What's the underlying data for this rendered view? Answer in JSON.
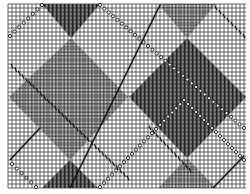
{
  "pattern": {
    "type": "argyle-knitting-chart",
    "background": "#ffffff",
    "grid": {
      "x": 8,
      "y": 4,
      "width": 238,
      "height": 184,
      "cell": 4,
      "color": "#222222"
    },
    "colors": {
      "dark": "#555555",
      "dotted": "#9a9a9a",
      "line": "#111111"
    },
    "diamonds": [
      {
        "name": "dark-top",
        "fill": "dark",
        "points": "42,4 100,4 71,38"
      },
      {
        "name": "dotted-left",
        "fill": "dotted",
        "points": "71,38 128,97 70,160 10,98 10,96"
      },
      {
        "name": "dark-right",
        "fill": "dark",
        "points": "187,38 246,97 187,158 129,97"
      },
      {
        "name": "dotted-top-right",
        "fill": "dotted",
        "points": "158,4 216,4 187,38"
      },
      {
        "name": "dark-bottom-left",
        "fill": "dark",
        "points": "70,160 98,188 42,188"
      },
      {
        "name": "dotted-bottom-right",
        "fill": "dotted",
        "points": "187,158 216,188 158,188"
      }
    ],
    "lines": [
      {
        "name": "circle-line-a",
        "style": "circles",
        "x1": 10,
        "y1": 36,
        "x2": 42,
        "y2": 5
      },
      {
        "name": "circle-line-b",
        "style": "circles",
        "x1": 100,
        "y1": 5,
        "x2": 244,
        "y2": 128
      },
      {
        "name": "circle-line-c",
        "style": "circles",
        "x1": 12,
        "y1": 164,
        "x2": 36,
        "y2": 187
      },
      {
        "name": "circle-line-d",
        "style": "circles",
        "x1": 100,
        "y1": 187,
        "x2": 184,
        "y2": 100
      },
      {
        "name": "circle-line-e",
        "style": "circles",
        "x1": 184,
        "y1": 100,
        "x2": 244,
        "y2": 160
      },
      {
        "name": "solid-line-a",
        "style": "solid",
        "x1": 70,
        "y1": 188,
        "x2": 160,
        "y2": 5
      },
      {
        "name": "solid-line-b",
        "style": "solid",
        "x1": 10,
        "y1": 160,
        "x2": 40,
        "y2": 128
      },
      {
        "name": "solid-line-c",
        "style": "solid",
        "x1": 213,
        "y1": 188,
        "x2": 244,
        "y2": 156
      },
      {
        "name": "dash-line-a",
        "style": "dash",
        "x1": 12,
        "y1": 66,
        "x2": 128,
        "y2": 178
      },
      {
        "name": "dash-line-b",
        "style": "dash",
        "x1": 216,
        "y1": 8,
        "x2": 244,
        "y2": 36
      },
      {
        "name": "dash-line-c",
        "style": "dash",
        "x1": 150,
        "y1": 128,
        "x2": 190,
        "y2": 170
      }
    ]
  }
}
